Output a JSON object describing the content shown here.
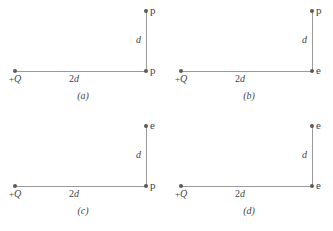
{
  "figure": {
    "background_color": "#ffffff",
    "line_color": "#9a9a9a",
    "dot_color": "#5a5a5a",
    "text_color": "#444444",
    "panels": [
      {
        "id": "a",
        "caption": "(a)",
        "charge_label_sign": "+",
        "charge_label_symbol": "Q",
        "horizontal_length_number": "2",
        "horizontal_length_symbol": "d",
        "vertical_length_label": "d",
        "top_point_label": "p",
        "corner_point_label": "p"
      },
      {
        "id": "b",
        "caption": "(b)",
        "charge_label_sign": "+",
        "charge_label_symbol": "Q",
        "horizontal_length_number": "2",
        "horizontal_length_symbol": "d",
        "vertical_length_label": "d",
        "top_point_label": "p",
        "corner_point_label": "e"
      },
      {
        "id": "c",
        "caption": "(c)",
        "charge_label_sign": "+",
        "charge_label_symbol": "Q",
        "horizontal_length_number": "2",
        "horizontal_length_symbol": "d",
        "vertical_length_label": "d",
        "top_point_label": "e",
        "corner_point_label": "p"
      },
      {
        "id": "d",
        "caption": "(d)",
        "charge_label_sign": "+",
        "charge_label_symbol": "Q",
        "horizontal_length_number": "2",
        "horizontal_length_symbol": "d",
        "vertical_length_label": "d",
        "top_point_label": "e",
        "corner_point_label": "e"
      }
    ]
  }
}
